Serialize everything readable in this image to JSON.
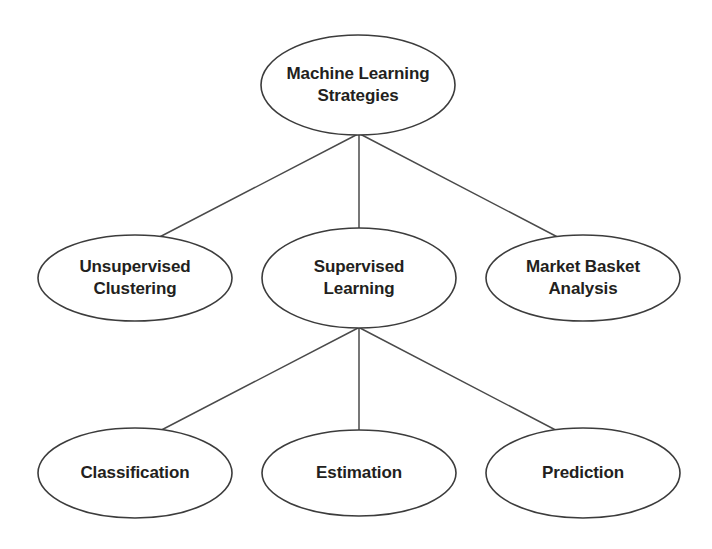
{
  "diagram": {
    "type": "tree",
    "background_color": "#ffffff",
    "node_fill": "#ffffff",
    "node_stroke": "#3c3c3c",
    "edge_color": "#4a4a4a",
    "text_color": "#231f20",
    "nodes": {
      "root": {
        "label_line1": "Machine Learning",
        "label_line2": "Strategies",
        "cx": 358,
        "cy": 85,
        "rx": 97,
        "ry": 50
      },
      "unsupervised_clustering": {
        "label_line1": "Unsupervised",
        "label_line2": "Clustering",
        "cx": 135,
        "cy": 278,
        "rx": 97,
        "ry": 43
      },
      "supervised_learning": {
        "label_line1": "Supervised",
        "label_line2": "Learning",
        "cx": 359,
        "cy": 278,
        "rx": 97,
        "ry": 50
      },
      "market_basket_analysis": {
        "label_line1": "Market Basket",
        "label_line2": "Analysis",
        "cx": 583,
        "cy": 278,
        "rx": 97,
        "ry": 43
      },
      "classification": {
        "label_line1": "Classification",
        "label_line2": "",
        "cx": 135,
        "cy": 473,
        "rx": 97,
        "ry": 45
      },
      "estimation": {
        "label_line1": "Estimation",
        "label_line2": "",
        "cx": 359,
        "cy": 473,
        "rx": 97,
        "ry": 43
      },
      "prediction": {
        "label_line1": "Prediction",
        "label_line2": "",
        "cx": 583,
        "cy": 473,
        "rx": 97,
        "ry": 45
      }
    },
    "edges": [
      {
        "name": "root-to-unsupervised-clustering",
        "x1": 358,
        "y1": 134,
        "x2": 148,
        "y2": 243
      },
      {
        "name": "root-to-supervised-learning",
        "x1": 359,
        "y1": 134,
        "x2": 359,
        "y2": 228
      },
      {
        "name": "root-to-market-basket-analysis",
        "x1": 360,
        "y1": 134,
        "x2": 569,
        "y2": 243
      },
      {
        "name": "supervised-to-classification",
        "x1": 358,
        "y1": 328,
        "x2": 148,
        "y2": 437
      },
      {
        "name": "supervised-to-estimation",
        "x1": 359,
        "y1": 328,
        "x2": 359,
        "y2": 430
      },
      {
        "name": "supervised-to-prediction",
        "x1": 360,
        "y1": 328,
        "x2": 569,
        "y2": 437
      }
    ]
  }
}
